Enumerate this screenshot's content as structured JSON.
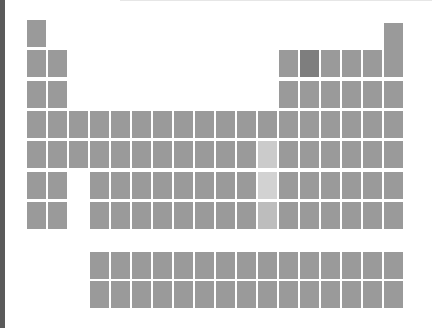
{
  "diagram": {
    "type": "periodic-table-silhouette",
    "colors": {
      "cell": "#9a9a9a",
      "highlight_dark": "#7e7e7e",
      "highlight_light": [
        "#cbcbcb",
        "#d2d2d2",
        "#bdbdbd"
      ],
      "background": "#ffffff",
      "left_border": "#5a5a5a"
    },
    "highlighted_cells": [
      {
        "period": 2,
        "group": 14,
        "style": "dark"
      },
      {
        "period": 5,
        "group": 12,
        "style": "hl1"
      },
      {
        "period": 6,
        "group": 12,
        "style": "hl2"
      },
      {
        "period": 7,
        "group": 12,
        "style": "hl3"
      }
    ],
    "main_rows": 7,
    "main_columns": 18,
    "f_block_rows": 2,
    "f_block_columns": 15
  }
}
